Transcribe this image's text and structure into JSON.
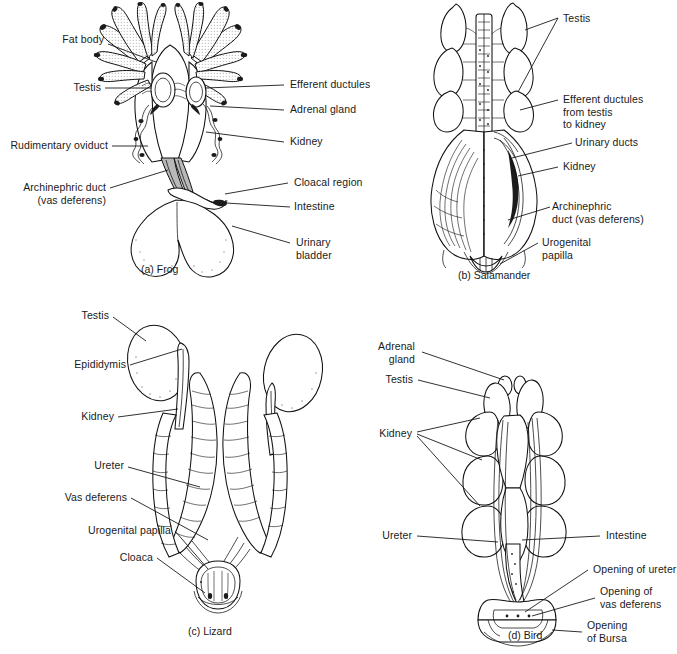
{
  "figure": {
    "panels": [
      {
        "id": "a",
        "caption": "(a) Frog",
        "animal": "Frog",
        "labels_left": [
          "Fat body",
          "Testis",
          "Rudimentary oviduct",
          "Archinephric duct\n(vas deferens)"
        ],
        "labels_right": [
          "Efferent ductules",
          "Adrenal gland",
          "Kidney",
          "Cloacal region",
          "Intestine",
          "Urinary\nbladder"
        ]
      },
      {
        "id": "b",
        "caption": "(b) Salamander",
        "animal": "Salamander",
        "labels_left": [],
        "labels_right": [
          "Testis",
          "Efferent ductules\nfrom testis\nto kidney",
          "Urinary ducts",
          "Kidney",
          "Archinephric\nduct (vas deferens)",
          "Urogenital\npapilla"
        ]
      },
      {
        "id": "c",
        "caption": "(c) Lizard",
        "animal": "Lizard",
        "labels_left": [
          "Testis",
          "Epididymis",
          "Kidney",
          "Ureter",
          "Vas deferens",
          "Urogenital papilla",
          "Cloaca"
        ],
        "labels_right": []
      },
      {
        "id": "d",
        "caption": "(d) Bird",
        "animal": "Bird",
        "labels_left": [
          "Adrenal\ngland",
          "Testis",
          "Kidney",
          "Ureter"
        ],
        "labels_right": [
          "Intestine",
          "Opening of ureter",
          "Opening of\nvas deferens",
          "Opening\nof Bursa"
        ]
      }
    ]
  },
  "colors": {
    "ink": "#1a1a1a",
    "background": "#ffffff",
    "stipple": "#2b2b2b"
  }
}
